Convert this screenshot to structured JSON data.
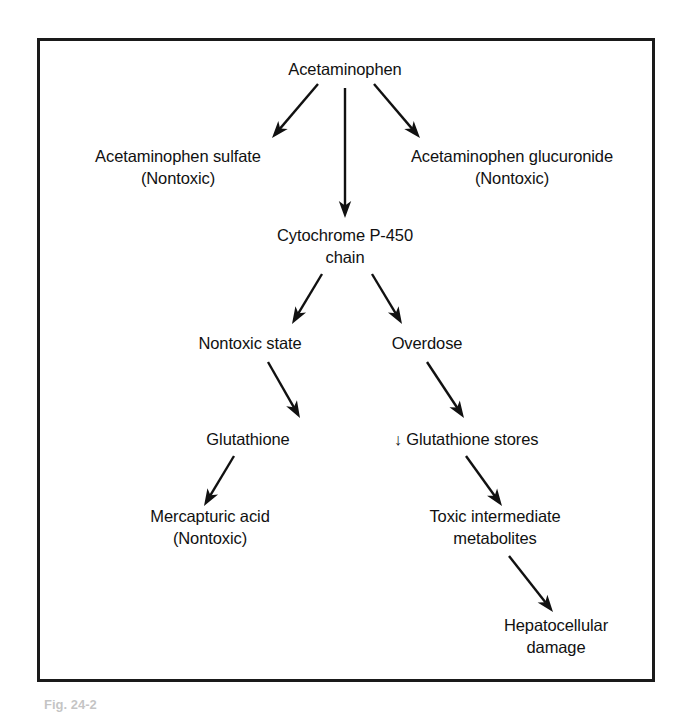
{
  "figure": {
    "type": "flowchart",
    "frame_color": "#1a1a1a",
    "background": "#ffffff",
    "text_color": "#111111",
    "caption_fragment": "Fig. 24-2"
  },
  "nodes": [
    {
      "id": "acetaminophen",
      "lines": [
        "Acetaminophen"
      ],
      "x": 345,
      "y": 70
    },
    {
      "id": "acetaminophen-sulfate",
      "lines": [
        "Acetaminophen sulfate",
        "(Nontoxic)"
      ],
      "x": 178,
      "y": 168
    },
    {
      "id": "acetaminophen-glucuronide",
      "lines": [
        "Acetaminophen glucuronide",
        "(Nontoxic)"
      ],
      "x": 512,
      "y": 168
    },
    {
      "id": "cytochrome-p450-chain",
      "lines": [
        "Cytochrome P-450",
        "chain"
      ],
      "x": 345,
      "y": 247
    },
    {
      "id": "nontoxic-state",
      "lines": [
        "Nontoxic state"
      ],
      "x": 250,
      "y": 344
    },
    {
      "id": "overdose",
      "lines": [
        "Overdose"
      ],
      "x": 427,
      "y": 344
    },
    {
      "id": "glutathione",
      "lines": [
        "Glutathione"
      ],
      "x": 248,
      "y": 440
    },
    {
      "id": "glutathione-stores-decreased",
      "lines": [
        "↓ Glutathione stores"
      ],
      "x": 466,
      "y": 440
    },
    {
      "id": "mercapturic-acid",
      "lines": [
        "Mercapturic acid",
        "(Nontoxic)"
      ],
      "x": 210,
      "y": 528
    },
    {
      "id": "toxic-intermediate-metabolites",
      "lines": [
        "Toxic intermediate",
        "metabolites"
      ],
      "x": 495,
      "y": 528
    },
    {
      "id": "hepatocellular-damage",
      "lines": [
        "Hepatocellular",
        "damage"
      ],
      "x": 556,
      "y": 637
    }
  ],
  "arrows": [
    {
      "id": "acetaminophen-to-sulfate",
      "from": "acetaminophen",
      "to": "acetaminophen-sulfate",
      "x1": 318,
      "y1": 84,
      "x2": 272,
      "y2": 138
    },
    {
      "id": "acetaminophen-to-cytochrome",
      "from": "acetaminophen",
      "to": "cytochrome-p450-chain",
      "x1": 345,
      "y1": 88,
      "x2": 345,
      "y2": 218
    },
    {
      "id": "acetaminophen-to-glucuronide",
      "from": "acetaminophen",
      "to": "acetaminophen-glucuronide",
      "x1": 374,
      "y1": 84,
      "x2": 420,
      "y2": 138
    },
    {
      "id": "cytochrome-to-nontoxic-state",
      "from": "cytochrome-p450-chain",
      "to": "nontoxic-state",
      "x1": 322,
      "y1": 274,
      "x2": 292,
      "y2": 324
    },
    {
      "id": "cytochrome-to-overdose",
      "from": "cytochrome-p450-chain",
      "to": "overdose",
      "x1": 372,
      "y1": 274,
      "x2": 402,
      "y2": 324
    },
    {
      "id": "nontoxic-state-to-glutathione",
      "from": "nontoxic-state",
      "to": "glutathione",
      "x1": 268,
      "y1": 362,
      "x2": 300,
      "y2": 418
    },
    {
      "id": "overdose-to-glutathione-stores",
      "from": "overdose",
      "to": "glutathione-stores-decreased",
      "x1": 427,
      "y1": 362,
      "x2": 464,
      "y2": 418
    },
    {
      "id": "glutathione-to-mercapturic-acid",
      "from": "glutathione",
      "to": "mercapturic-acid",
      "x1": 234,
      "y1": 456,
      "x2": 204,
      "y2": 506
    },
    {
      "id": "glutathione-stores-to-toxic",
      "from": "glutathione-stores-decreased",
      "to": "toxic-intermediate-metabolites",
      "x1": 466,
      "y1": 456,
      "x2": 502,
      "y2": 506
    },
    {
      "id": "toxic-to-hepatocellular-damage",
      "from": "toxic-intermediate-metabolites",
      "to": "hepatocellular-damage",
      "x1": 509,
      "y1": 556,
      "x2": 553,
      "y2": 612
    }
  ]
}
